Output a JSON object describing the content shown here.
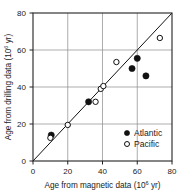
{
  "chart_data": {
    "type": "scatter",
    "title": "",
    "xlabel": "Age from magnetic data (10⁶ yr)",
    "xlabel_base": "Age from magnetic data (10",
    "xlabel_exp": "6",
    "xlabel_tail": " yr)",
    "ylabel": "Age from drilling data (10⁶ yr)",
    "ylabel_base": "Age from drilling data (10",
    "ylabel_exp": "6",
    "ylabel_tail": " yr)",
    "xlim": [
      0,
      80
    ],
    "ylim": [
      0,
      80
    ],
    "xticks": [
      0,
      20,
      40,
      60,
      80
    ],
    "yticks": [
      0,
      20,
      40,
      60,
      80
    ],
    "xtick_labels": [
      "0",
      "20",
      "40",
      "60",
      "80"
    ],
    "ytick_labels": [
      "0",
      "20",
      "40",
      "60",
      "80"
    ],
    "grid": true,
    "gridlines_x": [
      20,
      40,
      60
    ],
    "gridlines_y": [
      20,
      40,
      60
    ],
    "reference_line": {
      "name": "one-to-one line",
      "from": [
        0,
        0
      ],
      "to": [
        80,
        80
      ]
    },
    "legend_position": "bottom-right",
    "series": [
      {
        "name": "Atlantic",
        "marker": "filled-circle",
        "color": "#111111",
        "points": [
          [
            10.5,
            14.0
          ],
          [
            32.0,
            32.0
          ],
          [
            57.0,
            50.0
          ],
          [
            60.0,
            55.5
          ],
          [
            65.0,
            46.0
          ]
        ]
      },
      {
        "name": "Pacific",
        "marker": "open-circle",
        "color": "#111111",
        "points": [
          [
            10.0,
            12.5
          ],
          [
            20.0,
            19.5
          ],
          [
            36.0,
            32.0
          ],
          [
            39.0,
            39.0
          ],
          [
            40.5,
            40.5
          ],
          [
            48.0,
            53.5
          ],
          [
            73.0,
            66.5
          ]
        ]
      }
    ]
  },
  "legend": {
    "items": [
      {
        "label": "Atlantic",
        "marker": "filled-circle"
      },
      {
        "label": "Pacific",
        "marker": "open-circle"
      }
    ]
  }
}
